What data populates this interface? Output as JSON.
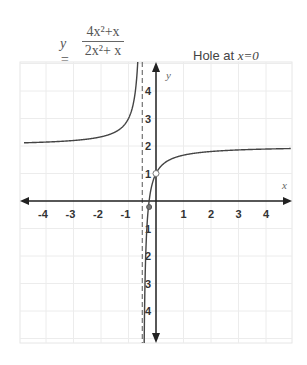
{
  "equation": {
    "lhs": "y =",
    "numerator": "4x²+x",
    "denominator": "2x²+ x"
  },
  "annotation": {
    "prefix": "Hole at ",
    "value": "x=0"
  },
  "chart_data": {
    "type": "line",
    "annotation": "Hole at x=0",
    "xlabel": "x",
    "ylabel": "y",
    "xlim": [
      -4.8,
      4.9
    ],
    "ylim": [
      -5,
      5.1
    ],
    "x_ticks": [
      -4,
      -3,
      -2,
      -1,
      1,
      2,
      3,
      4
    ],
    "y_ticks": [
      4,
      3,
      2,
      1,
      -1,
      -2,
      -3,
      -4
    ],
    "y_tick_labels": [
      "4",
      "3",
      "2",
      "1",
      "1",
      "2",
      "3",
      "4"
    ],
    "grid": true,
    "vertical_asymptote": -0.5,
    "horizontal_asymptote": 2,
    "hole": {
      "x": 0,
      "y": 1
    },
    "marked_point": {
      "x": -0.25,
      "y": 0
    },
    "series": [
      {
        "name": "left branch (x < -0.5)",
        "x": [
          -4.8,
          -4,
          -3,
          -2,
          -1.5,
          -1,
          -0.8,
          -0.7,
          -0.65
        ],
        "y": [
          2.11,
          2.14,
          2.2,
          2.33,
          2.5,
          3,
          3.67,
          4.5,
          5.33
        ]
      },
      {
        "name": "right branch (x > -0.5)",
        "x": [
          -0.45,
          -0.4,
          -0.3,
          -0.25,
          -0.2,
          0,
          0.5,
          1,
          2,
          3,
          4,
          4.9
        ],
        "y": [
          -8,
          -3,
          -0.5,
          0,
          0.33,
          1,
          1.5,
          1.67,
          1.8,
          1.86,
          1.89,
          1.91
        ]
      }
    ]
  }
}
